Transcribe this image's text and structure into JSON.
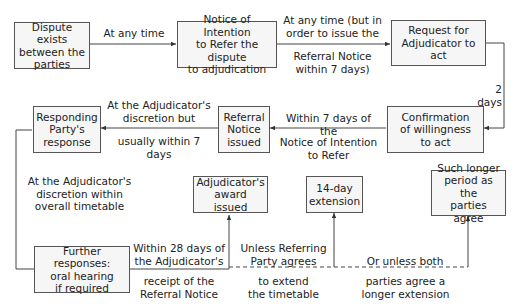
{
  "nodes": {
    "dispute": "Dispute exists\nbetween the\nparties",
    "notice_intention": "Notice of Intention\nto Refer the dispute\nto adjudication",
    "request": "Request for\nAdjudicator to act",
    "confirmation": "Confirmation\nof willingness\nto act",
    "referral": "Referral\nNotice\nissued",
    "responding": "Responding\nParty's\nresponse",
    "further": "Further responses:\noral hearing\nif required",
    "award": "Adjudicator's\naward issued",
    "extension14": "14-day\nextension",
    "longer": "Such longer\nperiod as the\nparties agree"
  },
  "edges": {
    "e1_above": "At any time",
    "e2_above": "At any time (but in\norder to issue the",
    "e2_below": "Referral Notice\nwithin 7 days)",
    "e3": "2 days",
    "e4_above": "Within 7 days of the",
    "e4_below": "Notice of Intention\nto Refer",
    "e5_above": "At the Adjudicator's\ndiscretion but",
    "e5_below": "usually within 7 days",
    "e6": "At the Adjudicator's\ndiscretion within\noverall timetable",
    "e7_above": "Within 28 days of\nthe Adjudicator's",
    "e7_below": "receipt of the\nReferral Notice",
    "e8_above": "Unless Referring\nParty agrees",
    "e8_below": "to extend\nthe timetable",
    "e9_above": "Or unless both",
    "e9_below": "parties agree a\nlonger extension"
  }
}
